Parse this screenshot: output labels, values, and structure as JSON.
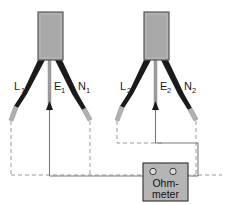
{
  "diagram": {
    "background_color": "#ffffff",
    "colors": {
      "plug_body_fill": "#a8a8a8",
      "plug_body_stroke": "#4d4d4d",
      "live_neutral_wire": "#1a1a1a",
      "earth_wire": "#8c8c8c",
      "dashed_wire": "#9a9a9a",
      "solid_wire": "#7a7a7a",
      "meter_fill": "#b5b5b5",
      "meter_stroke": "#3d3d3d",
      "label_text": "#1a1a1a",
      "terminal_fill": "#d9d9d9"
    }
  },
  "plugs": [
    {
      "id": "plug-left",
      "name": "left-plug",
      "conductors": [
        {
          "id": "L1",
          "base": "L",
          "subscript": "1",
          "role": "live",
          "label_x": 14,
          "label_y": 90
        },
        {
          "id": "E1",
          "base": "E",
          "subscript": "1",
          "role": "earth",
          "label_x": 54,
          "label_y": 90
        },
        {
          "id": "N1",
          "base": "N",
          "subscript": "1",
          "role": "neutral",
          "label_x": 78,
          "label_y": 90
        }
      ]
    },
    {
      "id": "plug-right",
      "name": "right-plug",
      "conductors": [
        {
          "id": "L2",
          "base": "L",
          "subscript": "2",
          "role": "live",
          "label_x": 120,
          "label_y": 90
        },
        {
          "id": "E2",
          "base": "E",
          "subscript": "2",
          "role": "earth",
          "label_x": 160,
          "label_y": 90
        },
        {
          "id": "N2",
          "base": "N",
          "subscript": "2",
          "role": "neutral",
          "label_x": 184,
          "label_y": 90
        }
      ]
    }
  ],
  "meter": {
    "id": "ohmmeter",
    "line1": "Ohm-",
    "line2": "meter",
    "terminals": [
      {
        "id": "terminal-left",
        "label": ""
      },
      {
        "id": "terminal-right",
        "label": ""
      }
    ]
  }
}
